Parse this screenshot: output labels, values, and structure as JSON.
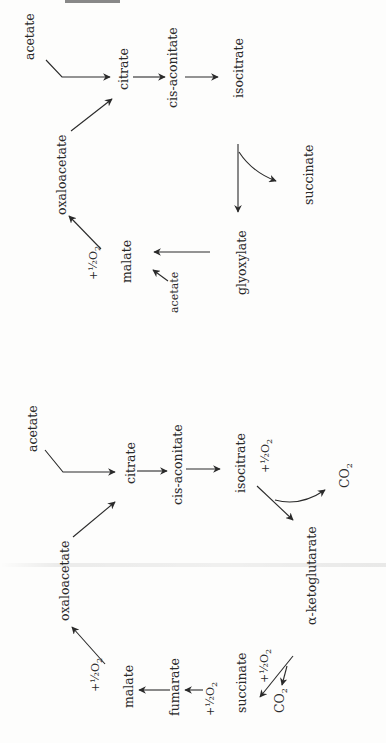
{
  "diagram": {
    "header_cut_text": "",
    "glyoxylate_cycle": {
      "nodes": {
        "acetate_in": "acetate",
        "citrate": "citrate",
        "cis_aconitate": "cis-aconitate",
        "isocitrate": "isocitrate",
        "succinate": "succinate",
        "glyoxylate": "glyoxylate",
        "malate": "malate",
        "acetate_to_malate": "acetate",
        "oxaloacetate": "oxaloacetate",
        "oxygen": "+½O",
        "oxygen_sub": "2"
      }
    },
    "tca_cycle": {
      "nodes": {
        "acetate_in": "acetate",
        "citrate": "citrate",
        "cis_aconitate": "cis-aconitate",
        "isocitrate": "isocitrate",
        "oxygen_isocitrate": "+½O",
        "oxygen_isocitrate_sub": "2",
        "co2_isocitrate": "CO",
        "co2_isocitrate_sub": "2",
        "alpha_ketoglutarate": "α-ketoglutarate",
        "succinate": "succinate",
        "oxygen_succinate": "+½O",
        "oxygen_succinate_sub": "2",
        "co2_succinate": "CO",
        "co2_succinate_sub": "2",
        "fumarate": "fumarate",
        "oxygen_fumarate": "+½O",
        "oxygen_fumarate_sub": "2",
        "malate": "malate",
        "oxygen_malate": "+½O",
        "oxygen_malate_sub": "2",
        "oxaloacetate": "oxaloacetate"
      }
    },
    "colors": {
      "ink": "#2a2a2a",
      "paper": "#fdfdfc"
    }
  }
}
